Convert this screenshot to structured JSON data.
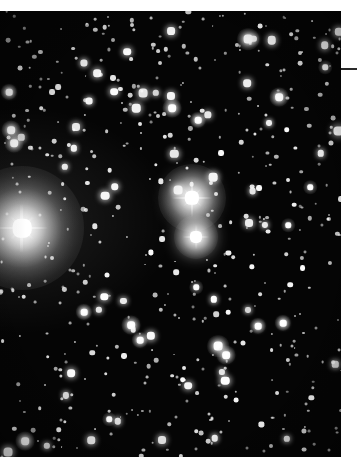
{
  "figure": {
    "kind": "astronomical-photograph",
    "background_color": "#050505",
    "page_color": "#ffffff",
    "plate": {
      "x": 0,
      "y": 11,
      "width": 341,
      "height": 446
    }
  },
  "annotations": {
    "leader_line": {
      "name": "pointer-line",
      "label": "",
      "color": "#2b2b2b",
      "x": 341,
      "y": 68,
      "width": 16,
      "thickness": 2
    }
  },
  "chart_data": {
    "type": "scatter",
    "title": "",
    "subtitle": "",
    "xlabel": "",
    "ylabel": "",
    "grid": false,
    "legend": null,
    "xlim": [
      0,
      341
    ],
    "ylim": [
      0,
      446
    ],
    "note": "Star positions in plate pixel coordinates (origin at plate top-left); r = apparent radius in px, b = relative brightness 0-1",
    "bright_stars": [
      {
        "name": "bright-star-west",
        "x": 22,
        "y": 217,
        "r": 17,
        "b": 1.0,
        "glow": 62,
        "spikes": true,
        "spike_len": 52
      },
      {
        "name": "double-star-north",
        "x": 192,
        "y": 187,
        "r": 13,
        "b": 0.97,
        "glow": 34,
        "spikes": true,
        "spike_len": 40
      },
      {
        "name": "double-star-south",
        "x": 196,
        "y": 226,
        "r": 11,
        "b": 0.9,
        "glow": 22,
        "spikes": true,
        "spike_len": 26
      }
    ],
    "medium_stars": [
      {
        "x": 248,
        "y": 28,
        "r": 8
      },
      {
        "x": 279,
        "y": 86,
        "r": 7
      },
      {
        "x": 172,
        "y": 97,
        "r": 7
      },
      {
        "x": 198,
        "y": 109,
        "r": 6
      },
      {
        "x": 11,
        "y": 119,
        "r": 7
      },
      {
        "x": 14,
        "y": 132,
        "r": 7
      },
      {
        "x": 9,
        "y": 81,
        "r": 6
      },
      {
        "x": 131,
        "y": 314,
        "r": 7
      },
      {
        "x": 140,
        "y": 329,
        "r": 6
      },
      {
        "x": 218,
        "y": 335,
        "r": 8
      },
      {
        "x": 226,
        "y": 344,
        "r": 7
      },
      {
        "x": 84,
        "y": 301,
        "r": 6
      },
      {
        "x": 258,
        "y": 315,
        "r": 6
      },
      {
        "x": 283,
        "y": 312,
        "r": 6
      },
      {
        "x": 25,
        "y": 430,
        "r": 7
      },
      {
        "x": 310,
        "y": 176,
        "r": 5
      },
      {
        "x": 325,
        "y": 56,
        "r": 5
      },
      {
        "x": 288,
        "y": 214,
        "r": 5
      },
      {
        "x": 196,
        "y": 276,
        "r": 5
      },
      {
        "x": 109,
        "y": 408,
        "r": 5
      }
    ],
    "faint_star_count": 520,
    "field_density": "dense-milky-way-field"
  }
}
